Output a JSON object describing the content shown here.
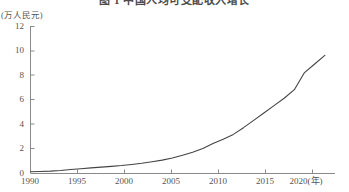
{
  "figure": {
    "title": "图 1  中国人均可支配收入增长",
    "y_axis_unit": "(万人民元)",
    "x_axis_unit": "(年)"
  },
  "chart_data": {
    "type": "line",
    "title": "图 1  中国人均可支配收入增长",
    "xlabel": "(年)",
    "ylabel": "(万人民元)",
    "xlim": [
      1990,
      2020
    ],
    "ylim": [
      0,
      12
    ],
    "grid": false,
    "legend": "none",
    "line_color": "#444444",
    "x_ticks": [
      "1990",
      "1995",
      "2000",
      "2005",
      "2010",
      "2015",
      "2020"
    ],
    "x_tick_values": [
      1990,
      1995,
      2000,
      2005,
      2010,
      2015,
      2020
    ],
    "y_ticks": [
      "0",
      "2",
      "4",
      "6",
      "8",
      "10",
      "12"
    ],
    "y_tick_values": [
      0,
      2,
      4,
      6,
      8,
      10,
      12
    ],
    "series": [
      {
        "name": "人均可支配收入",
        "x": [
          1990,
          1991,
          1992,
          1993,
          1994,
          1995,
          1996,
          1997,
          1998,
          1999,
          2000,
          2001,
          2002,
          2003,
          2004,
          2005,
          2006,
          2007,
          2008,
          2009,
          2010,
          2011,
          2012,
          2013,
          2014,
          2015,
          2016,
          2017,
          2018,
          2019
        ],
        "values": [
          0.1,
          0.12,
          0.15,
          0.2,
          0.28,
          0.35,
          0.42,
          0.48,
          0.54,
          0.61,
          0.7,
          0.8,
          0.92,
          1.05,
          1.22,
          1.45,
          1.7,
          2.0,
          2.4,
          2.75,
          3.15,
          3.7,
          4.3,
          4.9,
          5.5,
          6.1,
          6.8,
          8.2,
          8.9,
          9.6
        ]
      }
    ],
    "annotations": []
  }
}
